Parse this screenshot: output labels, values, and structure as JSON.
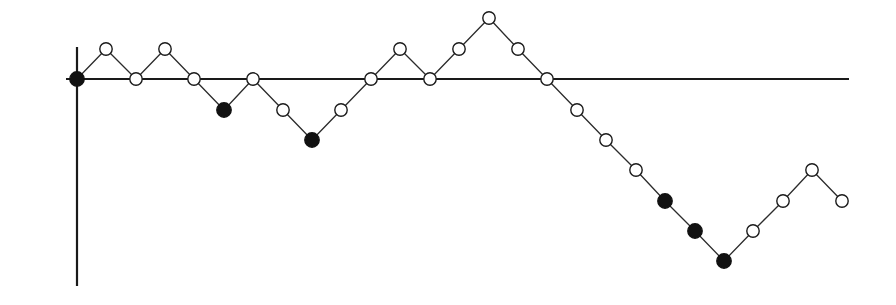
{
  "figure": {
    "title": "",
    "background_color": "#ffffff",
    "width": 896,
    "height": 305
  },
  "axes": {
    "x_axis": {
      "name": "horizontal-axis",
      "label": "",
      "color": "#1a1a1a",
      "line_width": 2.2,
      "x_start_px": 66,
      "x_end_px": 849,
      "y_px": 79
    },
    "y_axis": {
      "name": "vertical-axis",
      "label": "",
      "color": "#1a1a1a",
      "line_width": 2.2,
      "x_px": 77,
      "y_start_px": 47,
      "y_end_px": 286
    },
    "origin_px": {
      "x": 77,
      "y": 79
    },
    "x_step_px": 29.4,
    "y_step_px": 30.3,
    "ticks_visible": false,
    "tick_labels": [],
    "grid": false
  },
  "series": {
    "name": "random-walk",
    "line_color": "#2b2b2b",
    "line_width": 1.3,
    "marker_open_fill": "#ffffff",
    "marker_edge_color": "#1a1a1a",
    "marker_filled_color": "#111111",
    "marker_radius_px": 6.2,
    "marker_filled_radius_px": 7.2,
    "marker_edge_width": 1.4,
    "legend": [],
    "legend_position": "none"
  },
  "chart_data": {
    "type": "line",
    "title": "",
    "subtitle": "",
    "xlabel": "",
    "ylabel": "",
    "xlim": [
      -0.4,
      26.3
    ],
    "ylim": [
      -6.9,
      2.4
    ],
    "grid": false,
    "legend_position": "none",
    "annotations": [],
    "marker_legend": {
      "open_circle": "ordinary step",
      "filled_circle": "new record minimum"
    },
    "x": [
      0,
      1,
      2,
      3,
      4,
      5,
      6,
      7,
      8,
      9,
      10,
      11,
      12,
      13,
      14,
      15,
      16,
      17,
      18,
      19,
      20,
      21,
      22,
      23,
      24,
      25,
      26
    ],
    "y": [
      0,
      1,
      0,
      1,
      0,
      -1,
      0,
      -1,
      -2,
      -1,
      0,
      1,
      0,
      1,
      2,
      1,
      0,
      -1,
      -2,
      -3,
      -4,
      -5,
      -6,
      -5,
      -4,
      -3,
      -4
    ],
    "filled": [
      true,
      false,
      false,
      false,
      false,
      true,
      false,
      false,
      true,
      false,
      false,
      false,
      false,
      false,
      false,
      false,
      false,
      false,
      false,
      false,
      true,
      true,
      true,
      false,
      false,
      false,
      false
    ],
    "points_px": [
      {
        "x": 77,
        "y": 79,
        "filled": true
      },
      {
        "x": 106,
        "y": 49,
        "filled": false
      },
      {
        "x": 136,
        "y": 79,
        "filled": false
      },
      {
        "x": 165,
        "y": 49,
        "filled": false
      },
      {
        "x": 194,
        "y": 79,
        "filled": false
      },
      {
        "x": 224,
        "y": 110,
        "filled": true
      },
      {
        "x": 253,
        "y": 79,
        "filled": false
      },
      {
        "x": 283,
        "y": 110,
        "filled": false
      },
      {
        "x": 312,
        "y": 140,
        "filled": true
      },
      {
        "x": 341,
        "y": 110,
        "filled": false
      },
      {
        "x": 371,
        "y": 79,
        "filled": false
      },
      {
        "x": 400,
        "y": 49,
        "filled": false
      },
      {
        "x": 430,
        "y": 79,
        "filled": false
      },
      {
        "x": 459,
        "y": 49,
        "filled": false
      },
      {
        "x": 489,
        "y": 18,
        "filled": false
      },
      {
        "x": 518,
        "y": 49,
        "filled": false
      },
      {
        "x": 547,
        "y": 79,
        "filled": false
      },
      {
        "x": 577,
        "y": 110,
        "filled": false
      },
      {
        "x": 606,
        "y": 140,
        "filled": false
      },
      {
        "x": 636,
        "y": 170,
        "filled": false
      },
      {
        "x": 665,
        "y": 201,
        "filled": true
      },
      {
        "x": 695,
        "y": 231,
        "filled": true
      },
      {
        "x": 724,
        "y": 261,
        "filled": true
      },
      {
        "x": 753,
        "y": 231,
        "filled": false
      },
      {
        "x": 783,
        "y": 201,
        "filled": false
      },
      {
        "x": 812,
        "y": 170,
        "filled": false
      },
      {
        "x": 842,
        "y": 201,
        "filled": false
      }
    ]
  }
}
